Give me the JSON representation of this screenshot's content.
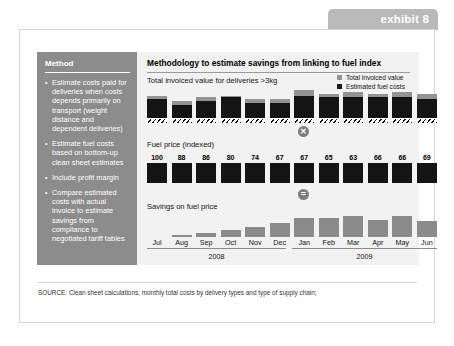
{
  "exhibit": {
    "tab_label": "exhibit 8"
  },
  "method": {
    "title": "Method",
    "bullet_glyph": "•",
    "items": [
      "Estimate costs paid for deliveries  when costs depends primarily on transport (weight distance and dependent deliveries)",
      "Estimate fuel costs based on bottom-up clean sheet estimates",
      "Include profit margin",
      "Compare estimated costs with actual invoice to estimate savings from compliance to negotiated tariff tables"
    ]
  },
  "chart_panel": {
    "title": "Methodology to estimate savings from linking to fuel index",
    "section_invoiced_label": "Total invoiced value for deliveries >3kg",
    "section_fuel_label": "Fuel price (indexed)",
    "section_savings_label": "Savings on fuel price",
    "operator_multiply": "✕",
    "operator_equals": "=",
    "legend": [
      {
        "label": "Total invoiced value",
        "color": "#939393"
      },
      {
        "label": "Estimated fuel costs",
        "color": "#1a1a1a"
      }
    ]
  },
  "source": {
    "text": "SOURCE:  Clean sheet calculations, monthly total costs by delivery types and type of supply chain;"
  },
  "chart_data": [
    {
      "type": "bar",
      "title": "Total invoiced value for deliveries >3kg",
      "stacked": true,
      "xlabel": "",
      "ylabel": "",
      "grid": false,
      "legend_position": "top-right",
      "categories": [
        "Jul",
        "Aug",
        "Sep",
        "Oct",
        "Nov",
        "Dec",
        "Jan",
        "Feb",
        "Mar",
        "Apr",
        "May",
        "Jun"
      ],
      "series": [
        {
          "name": "Estimated fuel costs",
          "color": "#141414",
          "values": [
            10,
            7,
            9,
            11,
            8,
            8,
            12,
            11,
            11,
            11,
            11,
            10
          ]
        },
        {
          "name": "Total invoiced value",
          "color": "#939393",
          "values": [
            12,
            9,
            11,
            12,
            10,
            10,
            15,
            13,
            14,
            13,
            14,
            13
          ]
        }
      ]
    },
    {
      "type": "bar",
      "title": "Fuel price (indexed)",
      "xlabel": "",
      "ylabel": "Index",
      "grid": false,
      "categories": [
        "Jul",
        "Aug",
        "Sep",
        "Oct",
        "Nov",
        "Dec",
        "Jan",
        "Feb",
        "Mar",
        "Apr",
        "May",
        "Jun"
      ],
      "values": [
        100,
        88,
        86,
        80,
        74,
        67,
        67,
        65,
        63,
        66,
        66,
        69
      ],
      "data_labels": [
        "100",
        "88",
        "86",
        "80",
        "74",
        "67",
        "67",
        "65",
        "63",
        "66",
        "66",
        "69"
      ]
    },
    {
      "type": "bar",
      "title": "Savings on fuel price",
      "xlabel": "",
      "ylabel": "",
      "grid": false,
      "categories": [
        "Jul",
        "Aug",
        "Sep",
        "Oct",
        "Nov",
        "Dec",
        "Jan",
        "Feb",
        "Mar",
        "Apr",
        "May",
        "Jun"
      ],
      "values": [
        0,
        2,
        3,
        6,
        8,
        11,
        15,
        15,
        17,
        14,
        17,
        13
      ]
    }
  ],
  "axis": {
    "months": [
      "Jul",
      "Aug",
      "Sep",
      "Oct",
      "Nov",
      "Dec",
      "Jan",
      "Feb",
      "Mar",
      "Apr",
      "May",
      "Jun"
    ],
    "years": [
      "2008",
      "2009"
    ]
  }
}
